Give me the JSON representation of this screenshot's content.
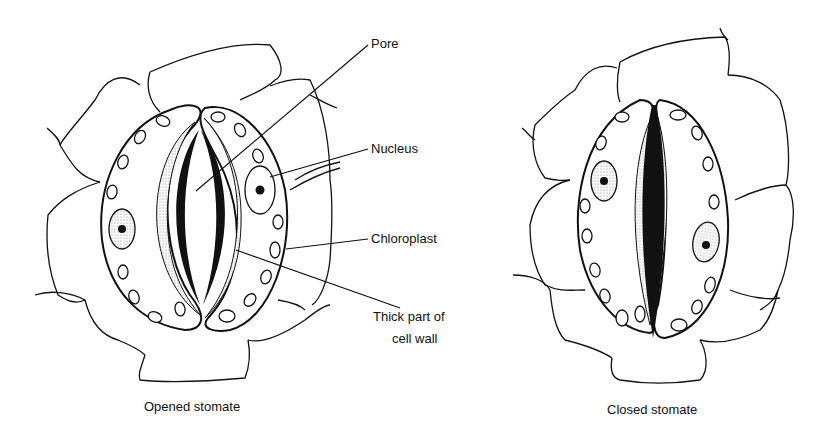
{
  "diagram": {
    "type": "biology-illustration",
    "panels": [
      {
        "id": "opened",
        "caption": "Opened stomate"
      },
      {
        "id": "closed",
        "caption": "Closed stomate"
      }
    ],
    "labels": {
      "pore": "Pore",
      "nucleus": "Nucleus",
      "chloroplast": "Chloroplast",
      "thick_wall_line1": "Thick part of",
      "thick_wall_line2": "cell wall"
    },
    "colors": {
      "line": "#111111",
      "background": "#ffffff",
      "stipple": "#bbbbbb"
    }
  }
}
